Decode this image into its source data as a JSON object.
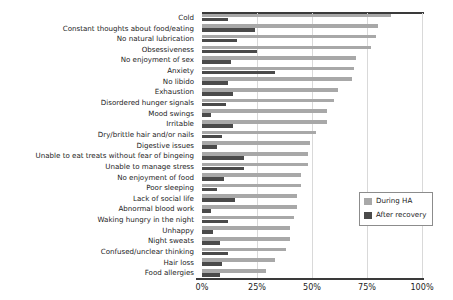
{
  "chart_data": {
    "type": "bar",
    "orientation": "horizontal",
    "title": "",
    "xlabel": "",
    "ylabel": "",
    "xlim": [
      0,
      100
    ],
    "xticks": [
      0,
      25,
      50,
      75,
      100
    ],
    "xtick_labels": [
      "0%",
      "25%",
      "50%",
      "75%",
      "100%"
    ],
    "grid": true,
    "legend_position": "center-right",
    "categories": [
      "Cold",
      "Constant thoughts about food/eating",
      "No natural lubrication",
      "Obsessiveness",
      "No enjoyment of sex",
      "Anxiety",
      "No libido",
      "Exhaustion",
      "Disordered hunger signals",
      "Mood swings",
      "Irritable",
      "Dry/brittle hair and/or nails",
      "Digestive issues",
      "Unable to eat treats without fear of bingeing",
      "Unable to manage stress",
      "No enjoyment of food",
      "Poor sleeping",
      "Lack of social life",
      "Abnormal blood work",
      "Waking hungry in the night",
      "Unhappy",
      "Night sweats",
      "Confused/unclear thinking",
      "Hair loss",
      "Food allergies"
    ],
    "series": [
      {
        "name": "During HA",
        "color": "#a8a8a8",
        "values": [
          86,
          80,
          79,
          77,
          70,
          69,
          68,
          62,
          60,
          57,
          57,
          52,
          49,
          48,
          48,
          45,
          45,
          43,
          43,
          42,
          40,
          40,
          38,
          33,
          29
        ]
      },
      {
        "name": "After recovery",
        "color": "#4a4a4a",
        "values": [
          12,
          24,
          16,
          25,
          13,
          33,
          12,
          14,
          11,
          4,
          14,
          9,
          7,
          19,
          19,
          10,
          7,
          15,
          4,
          12,
          5,
          8,
          12,
          9,
          8
        ]
      }
    ]
  },
  "legend": {
    "items": [
      {
        "label": "During HA"
      },
      {
        "label": "After recovery"
      }
    ]
  },
  "colors": {
    "during": "#a8a8a8",
    "after": "#4a4a4a",
    "axis": "#3a3a3a",
    "grid": "#d9d9d9",
    "background": "#ffffff"
  }
}
